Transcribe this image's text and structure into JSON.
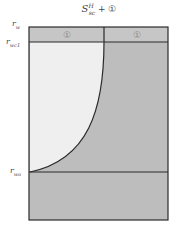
{
  "title": {
    "symbol": "S",
    "superscript": "H",
    "subscript": "sc",
    "suffix": " + ①"
  },
  "labels": {
    "r_w": {
      "main": "r",
      "sub": "w"
    },
    "r_wc1": {
      "main": "r",
      "sub": "wc1"
    },
    "r_wo": {
      "main": "r",
      "sub": "wo"
    }
  },
  "header_cells": [
    "①",
    "①"
  ],
  "colors": {
    "frame": "#2b2b2b",
    "shaded": "#bdbdbd",
    "header": "#c4c4c4",
    "light_region": "#efefef",
    "circle_text": "#888888"
  }
}
